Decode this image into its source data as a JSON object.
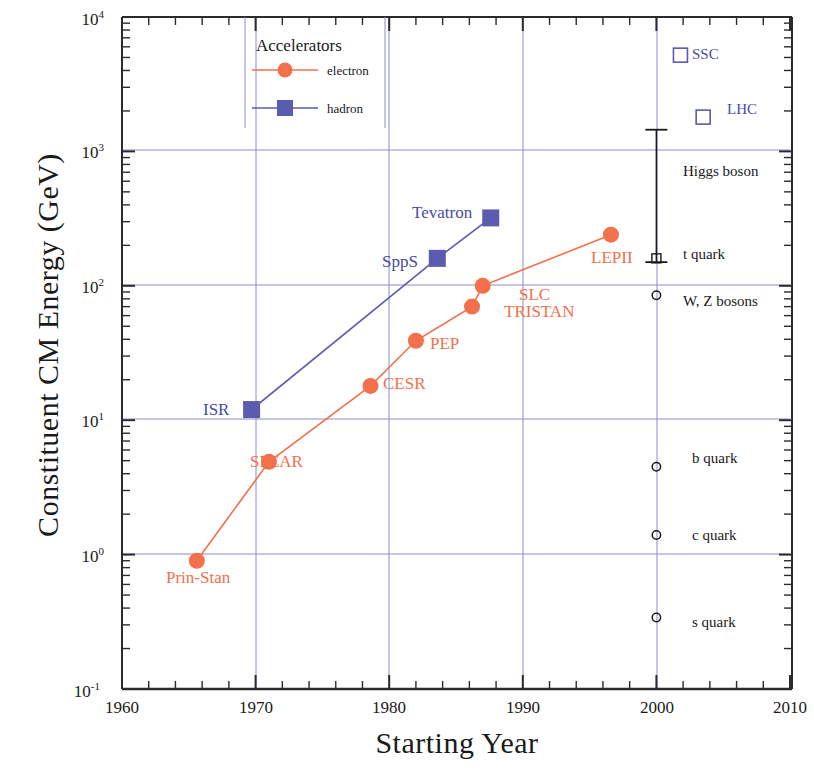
{
  "chart_data": {
    "type": "scatter",
    "title": "",
    "xlabel": "Starting Year",
    "ylabel": "Constituent CM Energy (GeV)",
    "xlim": [
      1960,
      2010
    ],
    "ylim": [
      0.1,
      10000
    ],
    "yscale": "log",
    "grid": true,
    "xticks": [
      1960,
      1970,
      1980,
      1990,
      2000,
      2010
    ],
    "yticks": [
      "10⁻¹",
      "10⁰",
      "10¹",
      "10²",
      "10³",
      "10⁴"
    ],
    "legend": {
      "title": "Accelerators",
      "position": "top-center",
      "entries": [
        {
          "name": "electron",
          "color": "#F2704B",
          "marker": "circle"
        },
        {
          "name": "hadron",
          "color": "#5B5BB0",
          "marker": "square"
        }
      ]
    },
    "series": [
      {
        "name": "electron",
        "color": "#F2704B",
        "marker": "circle",
        "points": [
          {
            "label": "Prin-Stan",
            "x": 1965.6,
            "y": 0.9
          },
          {
            "label": "SPEAR",
            "x": 1971.0,
            "y": 4.9
          },
          {
            "label": "CESR",
            "x": 1978.6,
            "y": 18
          },
          {
            "label": "PEP",
            "x": 1982.0,
            "y": 39
          },
          {
            "label": "TRISTAN",
            "x": 1986.2,
            "y": 70
          },
          {
            "label": "SLC",
            "x": 1987.0,
            "y": 100
          },
          {
            "label": "LEPII",
            "x": 1996.6,
            "y": 240
          }
        ]
      },
      {
        "name": "hadron",
        "color": "#5B5BB0",
        "marker": "square",
        "points": [
          {
            "label": "ISR",
            "x": 1969.7,
            "y": 12
          },
          {
            "label": "SppS",
            "x": 1983.6,
            "y": 160
          },
          {
            "label": "Tevatron",
            "x": 1987.6,
            "y": 320
          }
        ]
      }
    ],
    "future_machines": [
      {
        "label": "SSC",
        "x": 2001.8,
        "y": 5200,
        "marker": "open-square",
        "color": "#5B5BB0"
      },
      {
        "label": "LHC",
        "x": 2003.5,
        "y": 1800,
        "marker": "open-square",
        "color": "#5B5BB0"
      }
    ],
    "particle_markers": [
      {
        "label": "Higgs boson",
        "y_low": 150,
        "y_high": 1450,
        "marker": "errorbar",
        "x": 2000.0
      },
      {
        "label": "t quark",
        "y": 160,
        "marker": "open-square-small",
        "x": 2000.0
      },
      {
        "label": "W, Z bosons",
        "y": 85,
        "marker": "open-circle",
        "x": 2000.0
      },
      {
        "label": "b quark",
        "y": 4.5,
        "marker": "open-circle",
        "x": 2000.0
      },
      {
        "label": "c quark",
        "y": 1.4,
        "marker": "open-circle",
        "x": 2000.0
      },
      {
        "label": "s quark",
        "y": 0.34,
        "marker": "open-circle",
        "x": 2000.0
      }
    ]
  },
  "axes": {
    "x_title": "Starting Year",
    "y_title": "Constituent CM Energy (GeV)",
    "x_tick_labels": [
      "1960",
      "1970",
      "1980",
      "1990",
      "2000",
      "2010"
    ],
    "y_tick_mantissa": "10",
    "y_tick_exponents": [
      "4",
      "3",
      "2",
      "1",
      "0",
      "-1"
    ]
  },
  "legend": {
    "title": "Accelerators",
    "electron": "electron",
    "hadron": "hadron"
  },
  "labels": {
    "prin_stan": "Prin-Stan",
    "spear": "SPEAR",
    "cesr": "CESR",
    "pep": "PEP",
    "tristan": "TRISTAN",
    "slc": "SLC",
    "lepii": "LEPII",
    "isr": "ISR",
    "spps": "SppS",
    "tevatron": "Tevatron",
    "ssc": "SSC",
    "lhc": "LHC",
    "higgs": "Higgs boson",
    "t_quark": "t quark",
    "wz_bosons": "W, Z bosons",
    "b_quark": "b quark",
    "c_quark": "c quark",
    "s_quark": "s quark"
  },
  "colors": {
    "electron": "#F2704B",
    "hadron": "#5B5BB0",
    "grid": "#8888cc",
    "axis": "#333333",
    "text": "#1a1a1a"
  }
}
